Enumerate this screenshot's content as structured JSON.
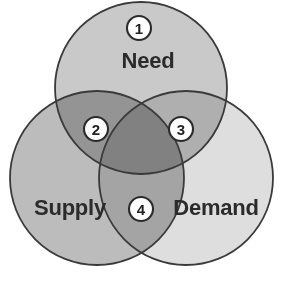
{
  "diagram": {
    "type": "venn",
    "set_count": 3,
    "canvas": {
      "width": 282,
      "height": 283,
      "background": "#ffffff"
    },
    "outline_color": "#3a3a3a",
    "sets": [
      {
        "id": "need",
        "label": "Need",
        "position": "top",
        "fill": "#c9c9c9",
        "cx": 141,
        "cy": 88,
        "r": 86,
        "label_x": 148,
        "label_y": 62
      },
      {
        "id": "supply",
        "label": "Supply",
        "position": "bottom-left",
        "fill": "#bcbcbc",
        "cx": 97,
        "cy": 178,
        "r": 87,
        "label_x": 70,
        "label_y": 209
      },
      {
        "id": "demand",
        "label": "Demand",
        "position": "bottom-right",
        "fill": "#dedede",
        "cx": 186,
        "cy": 178,
        "r": 87,
        "label_x": 216,
        "label_y": 209
      }
    ],
    "regions": [
      {
        "id": "region-1",
        "number": "1",
        "belongs_to": [
          "Need"
        ],
        "description": "Need only",
        "cx": 139,
        "cy": 28,
        "r": 12
      },
      {
        "id": "region-2",
        "number": "2",
        "belongs_to": [
          "Need",
          "Supply"
        ],
        "description": "Need and Supply",
        "cx": 96,
        "cy": 129,
        "r": 12
      },
      {
        "id": "region-3",
        "number": "3",
        "belongs_to": [
          "Need",
          "Demand"
        ],
        "description": "Need and Demand",
        "cx": 181,
        "cy": 129,
        "r": 12
      },
      {
        "id": "region-4",
        "number": "4",
        "belongs_to": [
          "Supply",
          "Demand"
        ],
        "description": "Supply and Demand",
        "cx": 141,
        "cy": 209,
        "r": 12
      }
    ]
  }
}
